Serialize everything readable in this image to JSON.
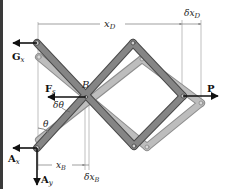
{
  "diagram": {
    "colors": {
      "link_dark": "#7a7a7a",
      "link_dark_edge": "#4a4a4a",
      "link_light": "#b3b3b3",
      "link_light_edge": "#8e8e8e",
      "arrow": "#111111",
      "dim_line": "#9a9a9a",
      "background": "#ffffff",
      "border": "#3a3a3a"
    },
    "labels": {
      "Gx": "G",
      "Gx_sub": "x",
      "Fs": "F",
      "Fs_sub": "s",
      "B": "B",
      "P": "P",
      "Ax": "A",
      "Ax_sub": "x",
      "Ay": "A",
      "Ay_sub": "y",
      "theta": "θ",
      "dtheta": "δθ",
      "xD": "x",
      "xD_sub": "D",
      "dxD": "δx",
      "dxD_sub": "D",
      "xB": "x",
      "xB_sub": "B",
      "dxB": "δx",
      "dxB_sub": "B"
    },
    "forces": [
      {
        "name": "G_x",
        "direction": "left",
        "at": "top-left pin"
      },
      {
        "name": "F_s",
        "direction": "left",
        "at": "B"
      },
      {
        "name": "P",
        "direction": "right",
        "at": "D"
      },
      {
        "name": "A_x",
        "direction": "left",
        "at": "A"
      },
      {
        "name": "A_y",
        "direction": "down",
        "at": "A"
      }
    ],
    "dimensions": [
      "x_D",
      "δx_D",
      "x_B",
      "δx_B",
      "θ",
      "δθ"
    ]
  }
}
